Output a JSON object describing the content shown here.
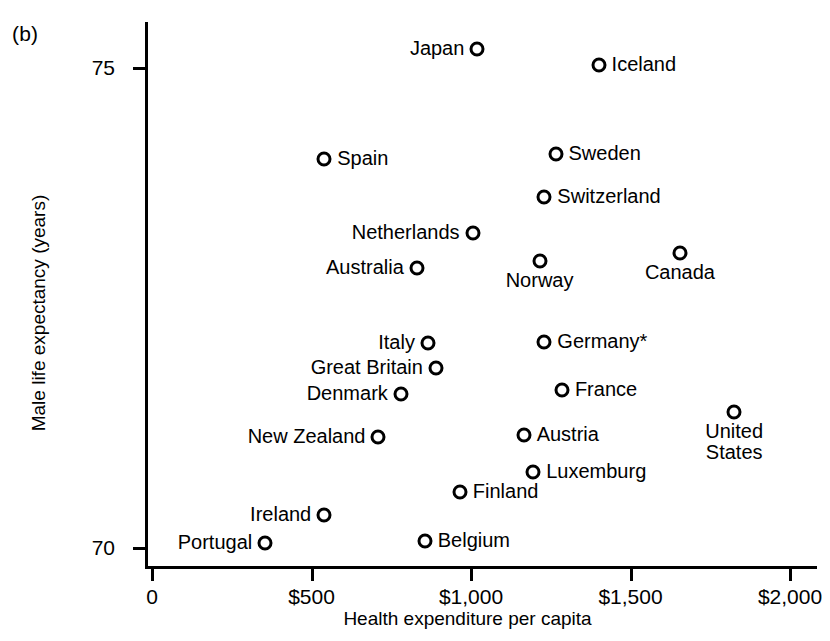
{
  "panel": {
    "label": "(b)"
  },
  "chart_data": {
    "type": "scatter",
    "title": "",
    "xlabel": "Health expenditure per capita",
    "ylabel": "Male life expectancy (years)",
    "xlim": [
      0,
      2100
    ],
    "ylim": [
      69.8,
      75.5
    ],
    "grid": false,
    "legend": null,
    "xticks": [
      {
        "value": 0,
        "label": "0"
      },
      {
        "value": 500,
        "label": "$500"
      },
      {
        "value": 1000,
        "label": "$1,000"
      },
      {
        "value": 1500,
        "label": "$1,500"
      },
      {
        "value": 2000,
        "label": "$2,000"
      }
    ],
    "yticks": [
      {
        "value": 75,
        "label": "75"
      },
      {
        "value": 70,
        "label": "70"
      }
    ],
    "points": [
      {
        "name": "Japan",
        "label": "Japan",
        "x": 1020,
        "y": 75.2,
        "label_pos": "left"
      },
      {
        "name": "Iceland",
        "label": "Iceland",
        "x": 1400,
        "y": 75.03,
        "label_pos": "right"
      },
      {
        "name": "Spain",
        "label": "Spain",
        "x": 540,
        "y": 74.05,
        "label_pos": "right"
      },
      {
        "name": "Sweden",
        "label": "Sweden",
        "x": 1265,
        "y": 74.1,
        "label_pos": "right"
      },
      {
        "name": "Switzerland",
        "label": "Switzerland",
        "x": 1230,
        "y": 73.66,
        "label_pos": "right"
      },
      {
        "name": "Netherlands",
        "label": "Netherlands",
        "x": 1005,
        "y": 73.28,
        "label_pos": "left"
      },
      {
        "name": "Canada",
        "label": "Canada",
        "x": 1655,
        "y": 73.07,
        "label_pos": "below"
      },
      {
        "name": "Australia",
        "label": "Australia",
        "x": 830,
        "y": 72.92,
        "label_pos": "left"
      },
      {
        "name": "Norway",
        "label": "Norway",
        "x": 1215,
        "y": 72.99,
        "label_pos": "below"
      },
      {
        "name": "Italy",
        "label": "Italy",
        "x": 865,
        "y": 72.14,
        "label_pos": "left"
      },
      {
        "name": "Germany*",
        "label": "Germany*",
        "x": 1230,
        "y": 72.15,
        "label_pos": "right"
      },
      {
        "name": "Great Britain",
        "label": "Great Britain",
        "x": 890,
        "y": 71.87,
        "label_pos": "left"
      },
      {
        "name": "France",
        "label": "France",
        "x": 1285,
        "y": 71.65,
        "label_pos": "right"
      },
      {
        "name": "Denmark",
        "label": "Denmark",
        "x": 780,
        "y": 71.6,
        "label_pos": "left"
      },
      {
        "name": "United States",
        "label": "United\nStates",
        "x": 1825,
        "y": 71.42,
        "label_pos": "below"
      },
      {
        "name": "New Zealand",
        "label": "New Zealand",
        "x": 710,
        "y": 71.16,
        "label_pos": "left"
      },
      {
        "name": "Austria",
        "label": "Austria",
        "x": 1165,
        "y": 71.18,
        "label_pos": "right"
      },
      {
        "name": "Luxemburg",
        "label": "Luxemburg",
        "x": 1195,
        "y": 70.79,
        "label_pos": "right"
      },
      {
        "name": "Finland",
        "label": "Finland",
        "x": 965,
        "y": 70.58,
        "label_pos": "right"
      },
      {
        "name": "Ireland",
        "label": "Ireland",
        "x": 540,
        "y": 70.34,
        "label_pos": "left"
      },
      {
        "name": "Portugal",
        "label": "Portugal",
        "x": 355,
        "y": 70.05,
        "label_pos": "left"
      },
      {
        "name": "Belgium",
        "label": "Belgium",
        "x": 855,
        "y": 70.07,
        "label_pos": "right"
      }
    ]
  }
}
